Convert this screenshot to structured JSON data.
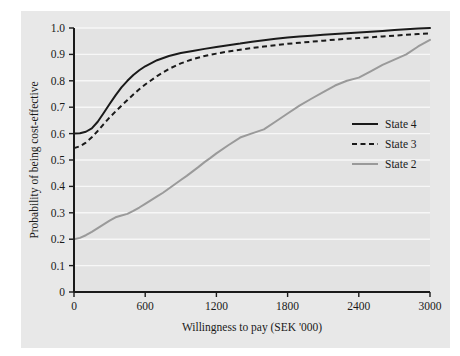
{
  "chart_data": {
    "type": "line",
    "title": "",
    "subtitle": "",
    "xlabel": "Willingness to pay (SEK '000)",
    "ylabel": "Probability of being cost-effective",
    "xlim": [
      0,
      3000
    ],
    "ylim": [
      0,
      1.0
    ],
    "xticks": [
      0,
      600,
      1200,
      1800,
      2400,
      3000
    ],
    "xtick_labels": [
      "0",
      "600",
      "1200",
      "1800",
      "2400",
      "3000"
    ],
    "yticks": [
      0,
      0.1,
      0.2,
      0.3,
      0.4,
      0.5,
      0.6,
      0.7,
      0.8,
      0.9,
      1.0
    ],
    "ytick_labels": [
      "0",
      "0.1",
      "0.2",
      "0.3",
      "0.4",
      "0.5",
      "0.6",
      "0.7",
      "0.8",
      "0.9",
      "1.0"
    ],
    "grid": "horizontal-white-gridlines",
    "panel_background": "#e3e3e3",
    "figure_background": "#e8e8e8",
    "legend_position": "right-middle",
    "series": [
      {
        "name": "State 4",
        "color": "#1a1a1a",
        "style": "solid",
        "width": 2.0,
        "x": [
          0,
          50,
          100,
          150,
          200,
          250,
          300,
          350,
          400,
          450,
          500,
          550,
          600,
          700,
          800,
          900,
          1000,
          1100,
          1200,
          1300,
          1400,
          1500,
          1600,
          1700,
          1800,
          1900,
          2000,
          2100,
          2200,
          2300,
          2400,
          2500,
          2600,
          2700,
          2800,
          2900,
          3000
        ],
        "y": [
          0.6,
          0.601,
          0.607,
          0.62,
          0.645,
          0.678,
          0.712,
          0.745,
          0.775,
          0.8,
          0.822,
          0.84,
          0.855,
          0.878,
          0.894,
          0.905,
          0.913,
          0.921,
          0.928,
          0.935,
          0.941,
          0.948,
          0.954,
          0.959,
          0.964,
          0.968,
          0.971,
          0.974,
          0.977,
          0.98,
          0.983,
          0.986,
          0.989,
          0.992,
          0.995,
          0.998,
          1.0
        ]
      },
      {
        "name": "State 3",
        "color": "#1a1a1a",
        "style": "dashed",
        "width": 2.0,
        "x": [
          0,
          50,
          100,
          150,
          200,
          250,
          300,
          350,
          400,
          450,
          500,
          550,
          600,
          700,
          800,
          900,
          1000,
          1100,
          1200,
          1300,
          1400,
          1500,
          1600,
          1700,
          1800,
          1900,
          2000,
          2100,
          2200,
          2300,
          2400,
          2500,
          2600,
          2700,
          2800,
          2900,
          3000
        ],
        "y": [
          0.545,
          0.552,
          0.566,
          0.586,
          0.61,
          0.636,
          0.661,
          0.684,
          0.706,
          0.727,
          0.748,
          0.768,
          0.786,
          0.818,
          0.845,
          0.866,
          0.882,
          0.894,
          0.903,
          0.911,
          0.918,
          0.924,
          0.93,
          0.935,
          0.94,
          0.944,
          0.948,
          0.952,
          0.956,
          0.959,
          0.962,
          0.965,
          0.968,
          0.971,
          0.974,
          0.977,
          0.98
        ]
      },
      {
        "name": "State 2",
        "color": "#9a9a9a",
        "style": "solid",
        "width": 2.0,
        "x": [
          0,
          50,
          100,
          150,
          200,
          250,
          300,
          350,
          400,
          450,
          500,
          550,
          600,
          650,
          700,
          750,
          800,
          850,
          900,
          950,
          1000,
          1050,
          1100,
          1150,
          1200,
          1300,
          1400,
          1500,
          1600,
          1700,
          1800,
          1900,
          2000,
          2100,
          2200,
          2300,
          2400,
          2500,
          2600,
          2700,
          2800,
          2900,
          3000
        ],
        "y": [
          0.2,
          0.205,
          0.215,
          0.228,
          0.242,
          0.256,
          0.27,
          0.283,
          0.29,
          0.296,
          0.307,
          0.32,
          0.334,
          0.348,
          0.362,
          0.376,
          0.392,
          0.408,
          0.424,
          0.44,
          0.457,
          0.474,
          0.492,
          0.508,
          0.525,
          0.556,
          0.585,
          0.601,
          0.616,
          0.646,
          0.676,
          0.706,
          0.732,
          0.757,
          0.782,
          0.8,
          0.812,
          0.836,
          0.86,
          0.88,
          0.9,
          0.93,
          0.955
        ]
      }
    ]
  },
  "legend": {
    "items": [
      {
        "label": "State 4",
        "style": "solid",
        "color": "#1a1a1a"
      },
      {
        "label": "State 3",
        "style": "dashed",
        "color": "#1a1a1a"
      },
      {
        "label": "State 2",
        "style": "solid",
        "color": "#9a9a9a"
      }
    ]
  }
}
